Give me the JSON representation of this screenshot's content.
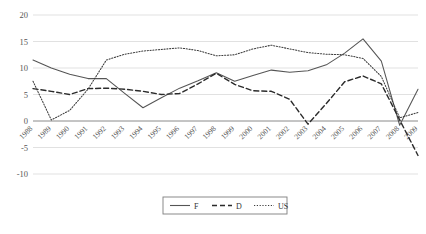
{
  "chart_data": {
    "type": "line",
    "title": "",
    "xlabel": "",
    "ylabel": "",
    "ylim": [
      -10,
      20
    ],
    "yticks": [
      20,
      15,
      10,
      5,
      0,
      -5,
      -10
    ],
    "grid": true,
    "legend_position": "bottom-center",
    "categories": [
      "1988",
      "1989",
      "1990",
      "1991",
      "1992",
      "1993",
      "1994",
      "1995",
      "1996",
      "1997",
      "1998",
      "1999",
      "2000",
      "2001",
      "2002",
      "2003",
      "2004",
      "2005",
      "2006",
      "2007",
      "2008",
      "2009"
    ],
    "series": [
      {
        "name": "F",
        "style": "solid",
        "color": "#555555",
        "values": [
          11.5,
          10.0,
          8.8,
          8.0,
          8.0,
          5.2,
          2.5,
          4.4,
          6.2,
          7.6,
          9.1,
          7.5,
          8.6,
          9.6,
          9.2,
          9.5,
          10.6,
          12.8,
          15.5,
          11.3,
          -0.8,
          6.0
        ]
      },
      {
        "name": "D",
        "style": "dashed",
        "color": "#2b2b2b",
        "values": [
          6.1,
          5.6,
          5.0,
          6.1,
          6.2,
          6.0,
          5.6,
          5.0,
          5.2,
          7.0,
          9.0,
          6.9,
          5.7,
          5.6,
          4.1,
          -0.6,
          3.3,
          7.4,
          8.5,
          7.0,
          0.2,
          -6.5
        ]
      },
      {
        "name": "US",
        "style": "dotted",
        "color": "#3d3d3d",
        "values": [
          7.5,
          0.2,
          2.0,
          6.0,
          11.5,
          12.6,
          13.2,
          13.5,
          13.8,
          13.3,
          12.3,
          12.5,
          13.6,
          14.3,
          13.6,
          12.9,
          12.6,
          12.5,
          11.8,
          8.4,
          0.6,
          1.6
        ]
      }
    ]
  },
  "legend": {
    "items": [
      {
        "label": "F",
        "style": "solid"
      },
      {
        "label": "D",
        "style": "dashed"
      },
      {
        "label": "US",
        "style": "dotted"
      }
    ]
  },
  "caption": {
    "text": ""
  }
}
